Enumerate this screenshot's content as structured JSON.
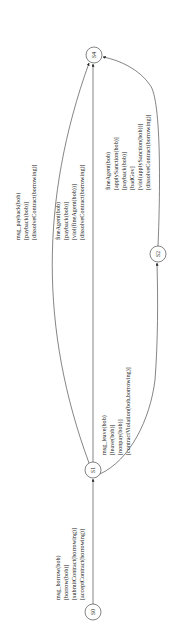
{
  "diagram": {
    "type": "state-machine",
    "orientation": "rotated-90-ccw",
    "states": [
      {
        "id": "S0",
        "label": "S0",
        "x": 93,
        "y": 612
      },
      {
        "id": "S1",
        "label": "S1",
        "x": 93,
        "y": 470
      },
      {
        "id": "S2",
        "label": "S2",
        "x": 158,
        "y": 254
      },
      {
        "id": "S4",
        "label": "S4",
        "x": 94,
        "y": 55
      }
    ],
    "transitions": [
      {
        "from": "S0",
        "to": "S1",
        "lines": [
          "msg_borrow(bob)",
          "[borrow(bob)]",
          "[submitContract(borrowing)]",
          "[acceptContract(borrowing)]"
        ]
      },
      {
        "from": "S1",
        "to": "S4",
        "route": "left-curve",
        "lines": [
          "msg_payback(bob)",
          "[payback(bob)]",
          "[dissolveContract(borrowing)]"
        ]
      },
      {
        "from": "S1",
        "to": "S4",
        "route": "straight",
        "lines": [
          "fineAgent(bob)",
          "[payback(bob)]",
          "[viol(fineAgent(bob))]",
          "[dissolveContract(borrowing)]"
        ]
      },
      {
        "from": "S1",
        "to": "S2",
        "route": "right-curve",
        "lines": [
          "msg_leave(bob)",
          "[leave(bob)]",
          "[nonpay(bob)]",
          "[contractViolation(bob,borrowing)]"
        ]
      },
      {
        "from": "S2",
        "to": "S4",
        "route": "right-curve",
        "lines": [
          "fineAgent(bob)",
          "[applySanction(bob)]",
          "[payback(bob)]",
          "[badGov]",
          "[viol(applySanction(bob))]",
          "[dissolveContract(borrowing)]"
        ]
      }
    ]
  }
}
